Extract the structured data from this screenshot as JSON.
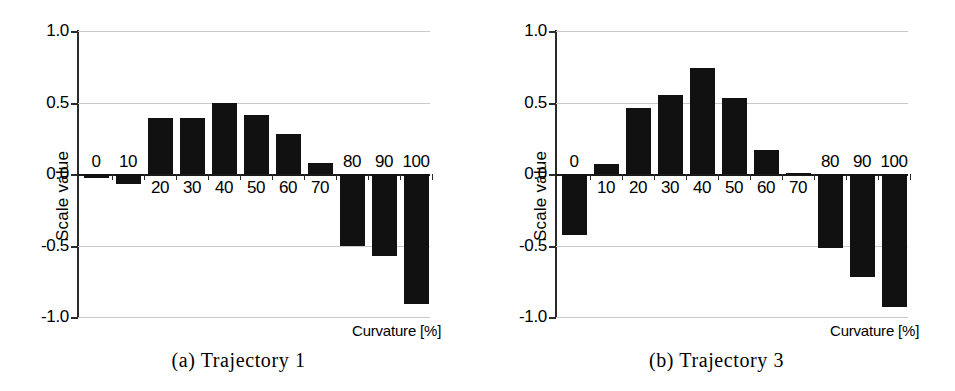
{
  "figure": {
    "background": "#ffffff",
    "bar_color": "#111111",
    "grid_color": "#c9c9c9",
    "axis_color": "#2a2a2a"
  },
  "panels": [
    {
      "caption": "(a) Trajectory 1",
      "ylabel": "Scale value",
      "xlabel": "Curvature [%]"
    },
    {
      "caption": "(b) Trajectory 3",
      "ylabel": "Scale value",
      "xlabel": "Curvature [%]"
    }
  ],
  "chart_data": [
    {
      "type": "bar",
      "title": "(a) Trajectory 1",
      "xlabel": "Curvature [%]",
      "ylabel": "Scale value",
      "categories": [
        "0",
        "10",
        "20",
        "30",
        "40",
        "50",
        "60",
        "70",
        "80",
        "90",
        "100"
      ],
      "values": [
        -0.03,
        -0.07,
        0.39,
        0.39,
        0.5,
        0.41,
        0.28,
        0.08,
        -0.5,
        -0.57,
        -0.91
      ],
      "ylim": [
        -1.0,
        1.0
      ],
      "yticks": [
        "1.0",
        "0.5",
        "0.0",
        "-0.5",
        "-1.0"
      ],
      "ytick_values": [
        1.0,
        0.5,
        0.0,
        -0.5,
        -1.0
      ],
      "grid": true,
      "legend": "none"
    },
    {
      "type": "bar",
      "title": "(b) Trajectory 3",
      "xlabel": "Curvature [%]",
      "ylabel": "Scale value",
      "categories": [
        "0",
        "10",
        "20",
        "30",
        "40",
        "50",
        "60",
        "70",
        "80",
        "90",
        "100"
      ],
      "values": [
        -0.43,
        0.07,
        0.46,
        0.55,
        0.74,
        0.53,
        0.17,
        0.01,
        -0.52,
        -0.72,
        -0.93
      ],
      "ylim": [
        -1.0,
        1.0
      ],
      "yticks": [
        "1.0",
        "0.5",
        "0.0",
        "-0.5",
        "-1.0"
      ],
      "ytick_values": [
        1.0,
        0.5,
        0.0,
        -0.5,
        -1.0
      ],
      "grid": true,
      "legend": "none"
    }
  ]
}
